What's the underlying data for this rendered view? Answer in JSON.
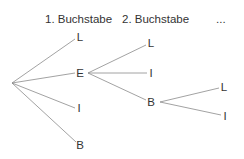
{
  "headers": {
    "level1": "1. Buchstabe",
    "level2": "2. Buchstabe",
    "more": "..."
  },
  "tree": {
    "root": {
      "x": 12,
      "y": 83
    },
    "level1": [
      {
        "label": "L",
        "x": 80,
        "y": 37
      },
      {
        "label": "E",
        "x": 80,
        "y": 73
      },
      {
        "label": "I",
        "x": 79,
        "y": 108
      },
      {
        "label": "B",
        "x": 80,
        "y": 145
      }
    ],
    "level2": [
      {
        "label": "L",
        "x": 151,
        "y": 43
      },
      {
        "label": "I",
        "x": 151,
        "y": 73
      },
      {
        "label": "B",
        "x": 151,
        "y": 102
      }
    ],
    "level3": [
      {
        "label": "L",
        "x": 224,
        "y": 87
      },
      {
        "label": "I",
        "x": 225,
        "y": 116
      }
    ]
  },
  "colors": {
    "edge": "#8a8a8a",
    "text": "#333333",
    "background": "#ffffff"
  }
}
